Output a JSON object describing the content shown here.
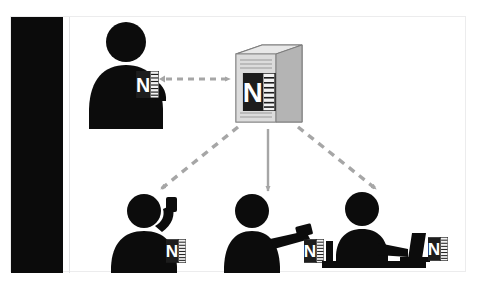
{
  "document": {
    "top_caption": "",
    "bottom_caption": ""
  },
  "figure": {
    "background_color": "#ffffff",
    "border_color": "#ececed",
    "left_band_color": "#0b0b0b"
  },
  "palette": {
    "silhouette": "#0c0c0c",
    "connector": "#a6a6a6",
    "onenote_purple": "#7a3b8e",
    "onenote_dark": "#1d1d1d",
    "server_light": "#d9d9d9",
    "server_mid": "#bfbfbf",
    "server_dark": "#8c8c8c",
    "paper": "#f2f2f2"
  },
  "nodes": [
    {
      "id": "author",
      "name": "author-person",
      "role": "Author",
      "icon": "person-with-notebook-icon",
      "notebook_letter": "N",
      "x": 20,
      "y": 18
    },
    {
      "id": "server",
      "name": "notebook-server",
      "role": "Shared notebook server",
      "icon": "server-tower-icon",
      "notebook_letter": "N",
      "x": 158,
      "y": 28
    },
    {
      "id": "reader-phone",
      "name": "reader-on-phone",
      "role": "Reader on phone",
      "icon": "person-phone-notebook-icon",
      "notebook_letter": "N",
      "x": 52,
      "y": 168
    },
    {
      "id": "reader-tablet",
      "name": "reader-on-tablet",
      "role": "Reader on tablet",
      "icon": "person-tablet-notebook-icon",
      "notebook_letter": "N",
      "x": 168,
      "y": 168
    },
    {
      "id": "reader-laptop",
      "name": "reader-on-laptop",
      "role": "Reader on laptop",
      "icon": "person-laptop-notebook-icon",
      "notebook_letter": "N",
      "x": 282,
      "y": 168
    }
  ],
  "connectors": [
    {
      "id": "author-server",
      "name": "connector-author-server",
      "from": "author",
      "to": "server",
      "style": "dashed",
      "direction": "bidirectional",
      "color": "#a6a6a6"
    },
    {
      "id": "server-phone",
      "name": "connector-server-reader-phone",
      "from": "server",
      "to": "reader-phone",
      "style": "dashed",
      "direction": "forward",
      "color": "#a6a6a6"
    },
    {
      "id": "server-tablet",
      "name": "connector-server-reader-tablet",
      "from": "server",
      "to": "reader-tablet",
      "style": "dashed",
      "direction": "forward",
      "color": "#a6a6a6"
    },
    {
      "id": "server-laptop",
      "name": "connector-server-reader-laptop",
      "from": "server",
      "to": "reader-laptop",
      "style": "dashed",
      "direction": "forward",
      "color": "#a6a6a6"
    }
  ]
}
